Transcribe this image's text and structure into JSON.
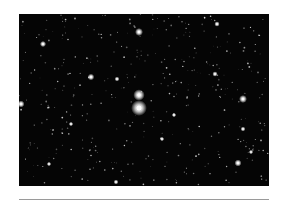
{
  "image": {
    "subject": "starfield",
    "background_color": "#050505",
    "star_color": "#ffffff",
    "central_stars": [
      {
        "x": 120,
        "y": 81,
        "r": 2.6
      },
      {
        "x": 120,
        "y": 94,
        "r": 3.6
      }
    ],
    "bright_stars": [
      {
        "x": 120,
        "y": 18,
        "r": 1.8
      },
      {
        "x": 24,
        "y": 30,
        "r": 1.4
      },
      {
        "x": 72,
        "y": 63,
        "r": 1.5
      },
      {
        "x": 2,
        "y": 90,
        "r": 1.6
      },
      {
        "x": 224,
        "y": 85,
        "r": 1.8
      },
      {
        "x": 219,
        "y": 149,
        "r": 1.6
      },
      {
        "x": 196,
        "y": 60,
        "r": 1.2
      },
      {
        "x": 198,
        "y": 10,
        "r": 1.2
      },
      {
        "x": 97,
        "y": 168,
        "r": 1.1
      },
      {
        "x": 98,
        "y": 65,
        "r": 1.1
      },
      {
        "x": 224,
        "y": 115,
        "r": 1.1
      },
      {
        "x": 143,
        "y": 125,
        "r": 1.0
      },
      {
        "x": 155,
        "y": 101,
        "r": 1.0
      },
      {
        "x": 52,
        "y": 110,
        "r": 1.0
      },
      {
        "x": 30,
        "y": 150,
        "r": 1.0
      },
      {
        "x": 232,
        "y": 138,
        "r": 1.0
      }
    ]
  },
  "divider": {
    "color": "#9a9a9a"
  }
}
